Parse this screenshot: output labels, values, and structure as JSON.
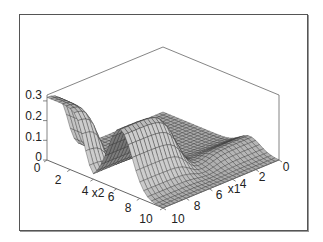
{
  "chart_data": {
    "type": "surface3d",
    "title": "",
    "xlabel": "x1",
    "ylabel": "x2",
    "zlabel": "",
    "x1_ticks": [
      "0",
      "2",
      "4",
      "6",
      "8",
      "10"
    ],
    "x2_ticks": [
      "0",
      "2",
      "4",
      "6",
      "8",
      "10"
    ],
    "z_ticks": [
      "0",
      "0.1",
      "0.2",
      "0.3"
    ],
    "xlim": [
      0,
      10
    ],
    "ylim": [
      0,
      10
    ],
    "zlim": [
      0,
      0.33
    ],
    "grid": false,
    "box": true,
    "shading": "gray mesh"
  },
  "axes": {
    "z_tick_labels": [
      "0.3",
      "0.2",
      "0.1",
      "0"
    ],
    "x2_tick_labels": [
      "0",
      "2",
      "4",
      "6",
      "8",
      "10"
    ],
    "x2_name": "x2",
    "x1_tick_labels": [
      "10",
      "8",
      "6",
      "4",
      "2",
      "0"
    ],
    "x1_name": "x1"
  }
}
